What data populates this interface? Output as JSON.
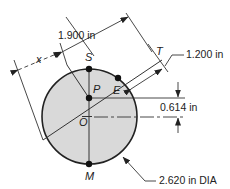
{
  "diagram": {
    "type": "technical-drawing",
    "points": {
      "S": "S",
      "T": "T",
      "P": "P",
      "E": "E",
      "O": "O",
      "M": "M"
    },
    "variable": "x",
    "dimensions": {
      "diagonal_length": "1.900 in",
      "offset": "1.200 in",
      "vertical_offset": "0.614 in",
      "diameter": "2.620 in DIA"
    },
    "colors": {
      "fill": "#d9d9d9",
      "stroke": "#222222",
      "background": "#ffffff"
    }
  }
}
